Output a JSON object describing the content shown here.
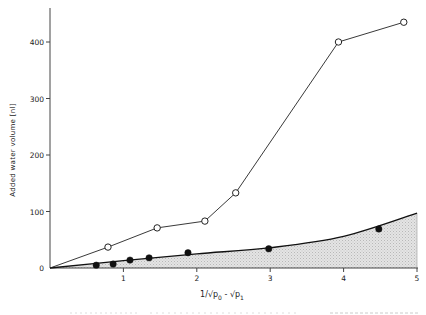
{
  "chart_data": {
    "type": "line",
    "title": "",
    "xlabel": "1/√p0 - √p1",
    "xlabel_parts": {
      "main": "1/√p",
      "sub0": "0",
      "mid": " - √p",
      "sub1": "1"
    },
    "ylabel": "Added water volume [nl]",
    "xlim": [
      0,
      5
    ],
    "ylim": [
      0,
      450
    ],
    "x_ticks": [
      1,
      2,
      3,
      4,
      5
    ],
    "y_ticks": [
      0,
      100,
      200,
      300,
      400
    ],
    "x_tick_labels": [
      "1",
      "2",
      "3",
      "4",
      "5"
    ],
    "y_tick_labels": [
      "0",
      "100",
      "200",
      "300",
      "400"
    ],
    "grid": false,
    "legend": null,
    "series": [
      {
        "name": "open circles",
        "marker": "open-circle",
        "line": "polyline",
        "points": [
          [
            0,
            0
          ],
          [
            0.79,
            37
          ],
          [
            1.46,
            71
          ],
          [
            2.11,
            83
          ],
          [
            2.53,
            133
          ],
          [
            3.93,
            400
          ],
          [
            4.82,
            435
          ]
        ]
      },
      {
        "name": "filled circles",
        "marker": "filled-circle",
        "points": [
          [
            0.63,
            5
          ],
          [
            0.86,
            7
          ],
          [
            1.09,
            14
          ],
          [
            1.35,
            18
          ],
          [
            1.88,
            27
          ],
          [
            2.98,
            34
          ],
          [
            4.48,
            69
          ]
        ]
      },
      {
        "name": "fitted curve (shaded area below)",
        "marker": "none",
        "line": "smooth",
        "fill": "hatched-gray",
        "points": [
          [
            0,
            0
          ],
          [
            1,
            13
          ],
          [
            2,
            25
          ],
          [
            3,
            36
          ],
          [
            4,
            56
          ],
          [
            5,
            97
          ]
        ]
      }
    ]
  },
  "caption_fragment": "… (partially visible text at bottom edge)"
}
